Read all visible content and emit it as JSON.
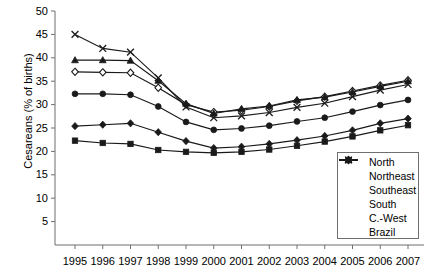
{
  "chart_data": {
    "type": "line",
    "title": "",
    "xlabel": "",
    "ylabel": "Cesareans (% of births)",
    "categories": [
      "1995",
      "1996",
      "1997",
      "1998",
      "1999",
      "2000",
      "2001",
      "2002",
      "2003",
      "2004",
      "2005",
      "2006",
      "2007"
    ],
    "ylim": [
      0,
      50
    ],
    "ytick_labels": [
      "50",
      "45",
      "40",
      "35",
      "30",
      "25",
      "20",
      "15",
      "10",
      "5"
    ],
    "ytick_values": [
      50,
      45,
      40,
      35,
      30,
      25,
      20,
      15,
      10,
      5
    ],
    "grid": false,
    "legend_position": "bottom-right",
    "series": [
      {
        "name": "North",
        "marker": "filled-diamond",
        "values": [
          25.4,
          25.7,
          26.0,
          24.1,
          22.2,
          20.7,
          21.0,
          21.6,
          22.4,
          23.3,
          24.5,
          26.0,
          27.0
        ]
      },
      {
        "name": "Northeast",
        "marker": "filled-square",
        "values": [
          22.3,
          21.8,
          21.6,
          20.3,
          19.9,
          19.7,
          19.9,
          20.4,
          21.2,
          22.1,
          23.2,
          24.5,
          25.6
        ]
      },
      {
        "name": "Southeast",
        "marker": "open-diamond",
        "values": [
          37.0,
          36.9,
          36.8,
          33.6,
          30.0,
          28.4,
          28.8,
          29.6,
          30.8,
          31.7,
          32.9,
          34.1,
          35.2
        ]
      },
      {
        "name": "South",
        "marker": "filled-triangle",
        "values": [
          39.5,
          39.5,
          39.4,
          35.1,
          30.2,
          28.1,
          29.1,
          29.7,
          31.0,
          31.6,
          32.7,
          33.9,
          35.0
        ]
      },
      {
        "name": "C.-West",
        "marker": "cross",
        "values": [
          45.0,
          42.0,
          41.2,
          35.7,
          29.5,
          27.2,
          27.6,
          28.3,
          29.4,
          30.3,
          31.7,
          33.1,
          34.3
        ]
      },
      {
        "name": "Brazil",
        "marker": "filled-circle",
        "values": [
          32.3,
          32.3,
          32.1,
          29.6,
          26.3,
          24.6,
          24.9,
          25.5,
          26.4,
          27.2,
          28.5,
          29.9,
          31.0
        ]
      }
    ]
  },
  "legend": {
    "items": [
      {
        "label": "North"
      },
      {
        "label": "Northeast"
      },
      {
        "label": "Southeast"
      },
      {
        "label": "South"
      },
      {
        "label": "C.-West"
      },
      {
        "label": "Brazil"
      }
    ]
  },
  "colors": {
    "line": "#1a1a1a",
    "axis": "#6f6f6f",
    "text": "#000000",
    "marker_fill": "#1a1a1a",
    "marker_open_fill": "#ffffff"
  }
}
